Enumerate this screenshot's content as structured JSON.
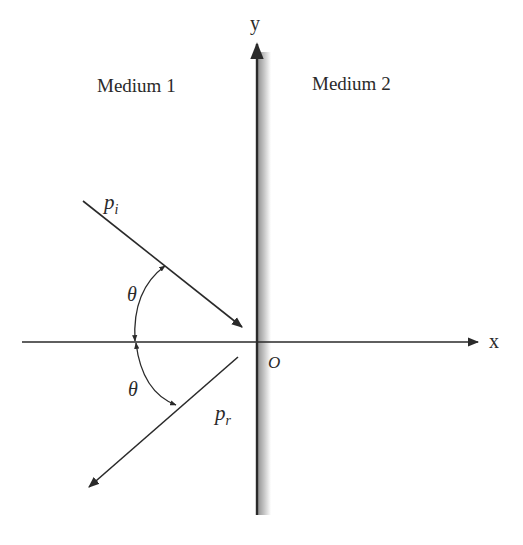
{
  "diagram": {
    "regions": {
      "left": "Medium 1",
      "right": "Medium 2"
    },
    "axes": {
      "x_label": "x",
      "y_label": "y",
      "origin_label": "O"
    },
    "rays": {
      "incident_label": "p",
      "incident_sub": "i",
      "reflected_label": "p",
      "reflected_sub": "r"
    },
    "angles": {
      "upper": "θ",
      "lower": "θ"
    },
    "colors": {
      "ink": "#2a2a2a",
      "boundary_shade": "#9a9a9a"
    }
  }
}
